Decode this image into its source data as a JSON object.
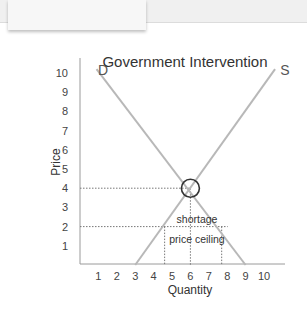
{
  "chart_data": {
    "type": "line",
    "title": "Government Intervention",
    "xlabel": "Quantity",
    "ylabel": "Price",
    "xlim": [
      0,
      10.5
    ],
    "ylim": [
      0,
      10.5
    ],
    "x_ticks": [
      "1",
      "2",
      "3",
      "4",
      "5",
      "6",
      "7",
      "8",
      "9",
      "10"
    ],
    "y_ticks": [
      "1",
      "2",
      "3",
      "4",
      "5",
      "6",
      "7",
      "8",
      "9",
      "10"
    ],
    "series": [
      {
        "name": "D",
        "label": "D",
        "points": [
          [
            0.9,
            10.2
          ],
          [
            9,
            0
          ]
        ]
      },
      {
        "name": "S",
        "label": "S",
        "points": [
          [
            3,
            0
          ],
          [
            10.6,
            10.2
          ]
        ]
      }
    ],
    "equilibrium": {
      "x": 6,
      "y": 4
    },
    "price_ceiling": {
      "y": 2,
      "qs": 4.6,
      "qd": 7.7,
      "q_mid": 6.1
    },
    "annotations": [
      "shortage",
      "price ceiling"
    ],
    "grid": false,
    "colors": {
      "lines": "#b8b8b8",
      "axis": "#9a9a9a",
      "text": "#333333",
      "circle": "#333333",
      "dotted": "#777777"
    }
  }
}
